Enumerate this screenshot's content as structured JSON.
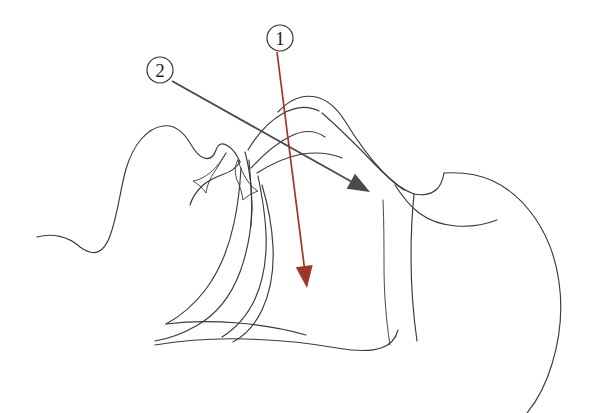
{
  "figure": {
    "background_color": "#ffffff",
    "width": 605,
    "height": 413,
    "line_color": "#3a3a3c"
  },
  "markers": [
    {
      "id": "marker-1",
      "label": "1",
      "cx": 280,
      "cy": 38,
      "r": 13,
      "color": "#1d1d1f"
    },
    {
      "id": "marker-2",
      "label": "2",
      "cx": 160,
      "cy": 70,
      "r": 13,
      "color": "#1d1d1f"
    }
  ],
  "callouts": [
    {
      "id": "callout-1",
      "marker": "1",
      "color": "#9e3528",
      "from_x": 277,
      "from_y": 52,
      "to_x": 307,
      "to_y": 288,
      "arrowhead": "solid-triangle"
    },
    {
      "id": "callout-2",
      "marker": "2",
      "color": "#4a4a4e",
      "from_x": 172,
      "from_y": 81,
      "to_x": 370,
      "to_y": 192,
      "arrowhead": "solid-triangle"
    }
  ],
  "anatomy_paths": [
    {
      "name": "face-profile-forehead-nose",
      "d": "M37,237 C52,233 68,236 80,247 C95,258 104,252 110,236 C118,214 120,190 126,169 C133,145 147,128 163,126 C176,124 184,133 190,143 C194,150 198,156 204,158 C210,160 214,156 216,150 C218,144 222,142 228,146 C233,149 237,155 240,162"
    },
    {
      "name": "upper-lip-and-palate",
      "d": "M240,162 C236,168 230,172 224,174 C216,177 208,180 202,186 C196,192 192,198 190,205"
    },
    {
      "name": "upper-incisor",
      "d": "M226,153 C222,160 217,167 211,172 C205,177 199,180 193,181 C198,184 203,188 206,193 C207,186 210,178 215,171 C219,165 223,158 226,153 Z"
    },
    {
      "name": "lower-incisor",
      "d": "M238,160 C240,167 243,174 247,180 C250,185 254,189 258,191 C252,193 247,196 243,200 C242,193 240,186 237,180 C235,174 234,166 238,160 Z"
    },
    {
      "name": "mandible-inner-edge",
      "d": "M245,152 C248,163 250,175 251,187 C252,200 252,213 251,226"
    },
    {
      "name": "tongue-dorsum",
      "d": "M249,160 C250,176 252,193 252,210 C251,232 247,253 240,272 C231,296 216,315 196,326 C182,334 167,339 155,341"
    },
    {
      "name": "tongue-body-lower",
      "d": "M241,168 C240,186 238,205 234,223 C229,247 220,270 206,289 C194,305 179,317 166,324"
    },
    {
      "name": "oropharynx-posterior-wall",
      "d": "M258,176 C262,195 265,214 266,233 C267,256 264,279 255,299 C247,316 235,329 222,337"
    },
    {
      "name": "epiglottis-line",
      "d": "M262,185 C268,205 272,226 273,247 C274,269 271,291 262,310 C255,325 244,336 233,342"
    },
    {
      "name": "soft-palate-arch",
      "d": "M248,150 C257,135 268,122 282,114 C294,107 307,105 319,111"
    },
    {
      "name": "hard-palate-upper-curve",
      "d": "M251,168 C263,155 276,143 291,136 C303,130 315,130 325,137"
    },
    {
      "name": "nasopharynx-roof",
      "d": "M257,173 C271,164 286,157 302,154 C316,152 330,153 342,158"
    },
    {
      "name": "head-crown-outline",
      "d": "M278,112 C289,100 302,94 316,97 C329,100 338,110 345,121 C356,139 368,156 382,171 C392,182 403,190 414,194"
    },
    {
      "name": "jaw-chin-lower-line",
      "d": "M322,113 C336,125 350,139 364,153 C377,167 390,180 404,190"
    },
    {
      "name": "neck-anterior-contour",
      "d": "M414,194 C423,196 432,194 437,189 C441,185 443,179 444,173"
    },
    {
      "name": "chest-upper-outline",
      "d": "M395,185 C402,196 410,206 419,213 C430,221 443,225 456,226 C470,227 484,225 497,220"
    },
    {
      "name": "shoulder-outline",
      "d": "M444,173 C461,172 478,174 493,181 C510,189 524,202 535,218 C548,237 556,259 559,282 C563,310 560,338 552,364 C546,384 537,401 527,413"
    },
    {
      "name": "torso-front-line",
      "d": "M414,194 C412,214 411,235 411,256 C411,285 413,313 417,341"
    },
    {
      "name": "posterior-neck-line",
      "d": "M155,345 C185,340 216,338 247,339 C278,340 309,343 337,348 C355,351 370,352 381,348 C390,345 396,338 398,330"
    },
    {
      "name": "lower-jaw-outer",
      "d": "M166,324 C190,321 214,321 238,323 C262,325 285,329 306,335"
    },
    {
      "name": "larynx-shadow",
      "d": "M383,200 C384,222 384,244 384,266 C384,293 386,319 390,345"
    }
  ]
}
